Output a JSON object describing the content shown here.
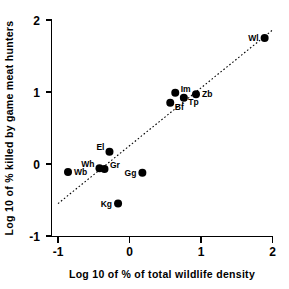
{
  "chart_data": {
    "type": "scatter",
    "title": "",
    "xlabel": "Log 10 of % of total wildlife density",
    "ylabel": "Log 10 of % killed by game meat hunters",
    "xlim": [
      -1,
      2
    ],
    "ylim": [
      -1,
      2
    ],
    "xticks": [
      "-1",
      "0",
      "1",
      "2"
    ],
    "yticks": [
      "-1",
      "0",
      "1",
      "2"
    ],
    "xtick_values": [
      -1,
      0,
      1,
      2
    ],
    "ytick_values": [
      -1,
      0,
      1,
      2
    ],
    "grid": false,
    "legend": false,
    "marker": "filled-circle",
    "marker_color": "#000000",
    "points": [
      {
        "label": "Wb",
        "x": -0.86,
        "y": -0.11,
        "label_pos": "right"
      },
      {
        "label": "Wh",
        "x": -0.42,
        "y": -0.06,
        "label_pos": "left-up"
      },
      {
        "label": "Gr",
        "x": -0.35,
        "y": -0.07,
        "label_pos": "right-up"
      },
      {
        "label": "El",
        "x": -0.28,
        "y": 0.17,
        "label_pos": "left-up"
      },
      {
        "label": "Gg",
        "x": 0.18,
        "y": -0.12,
        "label_pos": "left"
      },
      {
        "label": "Kg",
        "x": -0.16,
        "y": -0.55,
        "label_pos": "left"
      },
      {
        "label": "Bf",
        "x": 0.57,
        "y": 0.85,
        "label_pos": "right-down"
      },
      {
        "label": "Tp",
        "x": 0.76,
        "y": 0.92,
        "label_pos": "right-down"
      },
      {
        "label": "Im",
        "x": 0.64,
        "y": 0.99,
        "label_pos": "right-up"
      },
      {
        "label": "Zb",
        "x": 0.93,
        "y": 0.97,
        "label_pos": "right"
      },
      {
        "label": "Wl",
        "x": 1.89,
        "y": 1.75,
        "label_pos": "left"
      }
    ],
    "trend_line": {
      "style": "dotted",
      "color": "#000000",
      "x_start": -1.0,
      "y_start": -0.55,
      "x_end": 2.0,
      "y_end": 1.86
    }
  }
}
